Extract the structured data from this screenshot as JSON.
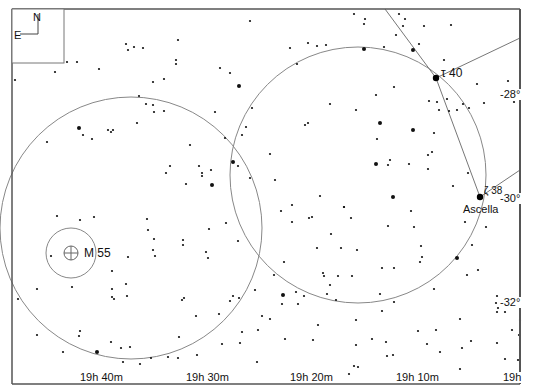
{
  "chart": {
    "type": "star-chart",
    "frame": {
      "left": 12,
      "top": 9,
      "right": 520,
      "bottom": 384,
      "color": "#555555"
    },
    "compass": {
      "north_label": "N",
      "east_label": "E"
    },
    "ra_labels": [
      {
        "text": "19h 40m",
        "x": 79
      },
      {
        "text": "19h 30m",
        "x": 185
      },
      {
        "text": "19h 20m",
        "x": 289
      },
      {
        "text": "19h 10m",
        "x": 395
      },
      {
        "text": "19h",
        "x": 502
      }
    ],
    "dec_labels": [
      {
        "text": "-28°",
        "x": 500,
        "y": 90
      },
      {
        "text": "-30°",
        "x": 500,
        "y": 194
      },
      {
        "text": "-32°",
        "x": 500,
        "y": 298
      }
    ],
    "circles": [
      {
        "name": "field-circle-left",
        "cx": 131,
        "cy": 228,
        "r": 131
      },
      {
        "name": "field-circle-right",
        "cx": 358,
        "cy": 175,
        "r": 128
      },
      {
        "name": "m55-ring",
        "cx": 71,
        "cy": 253,
        "r": 25
      }
    ],
    "constellation_lines": [
      [
        [
          385,
          9
        ],
        [
          436,
          78
        ]
      ],
      [
        [
          436,
          78
        ],
        [
          520,
          38
        ]
      ],
      [
        [
          436,
          78
        ],
        [
          480,
          197
        ]
      ],
      [
        [
          480,
          197
        ],
        [
          520,
          170
        ]
      ]
    ],
    "labeled_objects": [
      {
        "name": "M 55",
        "type": "globular-cluster",
        "x": 71,
        "y": 253,
        "label_x": 84,
        "label_y": 247
      },
      {
        "name": "τ 40",
        "type": "star",
        "x": 436,
        "y": 78,
        "label_x": 441,
        "label_y": 67
      },
      {
        "name": "Ascella",
        "type": "star",
        "x": 480,
        "y": 197,
        "label_x": 463,
        "label_y": 204
      },
      {
        "name": "ζ 38",
        "type": "star-designation",
        "x": 480,
        "y": 197,
        "label_x": 484,
        "label_y": 186
      }
    ],
    "stars": [
      [
        15,
        80,
        1
      ],
      [
        55,
        72,
        1
      ],
      [
        67,
        62,
        1
      ],
      [
        77,
        62,
        1
      ],
      [
        99,
        69,
        1
      ],
      [
        128,
        50,
        1
      ],
      [
        126,
        44,
        1
      ],
      [
        134,
        47,
        1
      ],
      [
        143,
        48,
        1
      ],
      [
        178,
        40,
        1
      ],
      [
        176,
        60,
        1
      ],
      [
        176,
        64,
        1
      ],
      [
        153,
        82,
        1
      ],
      [
        164,
        79,
        1
      ],
      [
        239,
        86,
        2
      ],
      [
        230,
        73,
        1
      ],
      [
        250,
        21,
        1
      ],
      [
        290,
        48,
        1
      ],
      [
        297,
        64,
        1
      ],
      [
        308,
        43,
        1
      ],
      [
        317,
        46,
        1
      ],
      [
        326,
        45,
        1
      ],
      [
        354,
        14,
        1
      ],
      [
        365,
        19,
        1
      ],
      [
        364,
        24,
        1
      ],
      [
        364,
        49,
        2
      ],
      [
        399,
        14,
        1
      ],
      [
        405,
        19,
        1
      ],
      [
        403,
        26,
        1
      ],
      [
        424,
        26,
        1
      ],
      [
        451,
        25,
        1
      ],
      [
        419,
        44,
        1
      ],
      [
        396,
        35,
        1
      ],
      [
        384,
        47,
        1
      ],
      [
        413,
        50,
        2
      ],
      [
        444,
        60,
        1
      ],
      [
        508,
        81,
        1
      ],
      [
        514,
        102,
        1
      ],
      [
        79,
        128,
        2
      ],
      [
        83,
        135,
        1
      ],
      [
        92,
        139,
        1
      ],
      [
        108,
        130,
        1
      ],
      [
        113,
        130,
        1
      ],
      [
        111,
        132,
        1
      ],
      [
        47,
        142,
        1
      ],
      [
        137,
        123,
        1
      ],
      [
        139,
        96,
        1
      ],
      [
        146,
        104,
        1
      ],
      [
        153,
        105,
        1
      ],
      [
        154,
        112,
        1
      ],
      [
        164,
        111,
        1
      ],
      [
        190,
        145,
        1
      ],
      [
        215,
        112,
        1
      ],
      [
        220,
        68,
        1
      ],
      [
        199,
        166,
        1
      ],
      [
        211,
        170,
        1
      ],
      [
        202,
        173,
        1
      ],
      [
        202,
        176,
        1
      ],
      [
        212,
        185,
        2
      ],
      [
        170,
        166,
        1
      ],
      [
        166,
        173,
        1
      ],
      [
        186,
        184,
        1
      ],
      [
        225,
        138,
        1
      ],
      [
        233,
        162,
        2
      ],
      [
        238,
        166,
        1
      ],
      [
        242,
        135,
        1
      ],
      [
        246,
        127,
        1
      ],
      [
        252,
        108,
        1
      ],
      [
        250,
        178,
        1
      ],
      [
        270,
        154,
        1
      ],
      [
        275,
        180,
        1
      ],
      [
        281,
        211,
        1
      ],
      [
        308,
        123,
        1
      ],
      [
        305,
        125,
        1
      ],
      [
        330,
        104,
        1
      ],
      [
        356,
        110,
        1
      ],
      [
        380,
        123,
        2
      ],
      [
        394,
        87,
        1
      ],
      [
        376,
        95,
        1
      ],
      [
        376,
        164,
        2
      ],
      [
        377,
        139,
        1
      ],
      [
        390,
        160,
        1
      ],
      [
        388,
        165,
        1
      ],
      [
        351,
        218,
        1
      ],
      [
        344,
        207,
        1
      ],
      [
        352,
        276,
        1
      ],
      [
        320,
        196,
        1
      ],
      [
        292,
        222,
        1
      ],
      [
        309,
        218,
        1
      ],
      [
        292,
        205,
        1
      ],
      [
        312,
        217,
        1
      ],
      [
        331,
        234,
        1
      ],
      [
        341,
        248,
        1
      ],
      [
        344,
        207,
        1
      ],
      [
        323,
        273,
        1
      ],
      [
        330,
        285,
        1
      ],
      [
        284,
        262,
        1
      ],
      [
        317,
        248,
        1
      ],
      [
        357,
        250,
        1
      ],
      [
        388,
        226,
        1
      ],
      [
        382,
        268,
        1
      ],
      [
        394,
        268,
        1
      ],
      [
        393,
        197,
        2
      ],
      [
        409,
        164,
        1
      ],
      [
        411,
        211,
        1
      ],
      [
        414,
        227,
        1
      ],
      [
        421,
        246,
        1
      ],
      [
        422,
        257,
        1
      ],
      [
        420,
        262,
        1
      ],
      [
        428,
        169,
        1
      ],
      [
        432,
        152,
        1
      ],
      [
        434,
        133,
        1
      ],
      [
        429,
        101,
        1
      ],
      [
        437,
        102,
        1
      ],
      [
        449,
        111,
        1
      ],
      [
        447,
        99,
        1
      ],
      [
        439,
        110,
        1
      ],
      [
        457,
        110,
        1
      ],
      [
        469,
        108,
        1
      ],
      [
        463,
        104,
        1
      ],
      [
        413,
        130,
        2
      ],
      [
        428,
        155,
        1
      ],
      [
        484,
        103,
        1
      ],
      [
        477,
        84,
        1
      ],
      [
        468,
        173,
        1
      ],
      [
        453,
        186,
        1
      ],
      [
        465,
        222,
        1
      ],
      [
        478,
        270,
        1
      ],
      [
        486,
        227,
        1
      ],
      [
        434,
        289,
        1
      ],
      [
        457,
        258,
        2
      ],
      [
        467,
        275,
        1
      ],
      [
        436,
        330,
        1
      ],
      [
        460,
        319,
        1
      ],
      [
        472,
        245,
        1
      ],
      [
        497,
        296,
        1
      ],
      [
        498,
        308,
        1
      ],
      [
        497,
        312,
        1
      ],
      [
        505,
        312,
        1
      ],
      [
        512,
        330,
        1
      ],
      [
        519,
        335,
        1
      ],
      [
        520,
        320,
        1
      ],
      [
        80,
        220,
        1
      ],
      [
        94,
        217,
        1
      ],
      [
        147,
        219,
        1
      ],
      [
        148,
        230,
        1
      ],
      [
        154,
        239,
        1
      ],
      [
        153,
        250,
        1
      ],
      [
        155,
        256,
        1
      ],
      [
        183,
        240,
        1
      ],
      [
        209,
        229,
        1
      ],
      [
        226,
        223,
        1
      ],
      [
        238,
        241,
        1
      ],
      [
        112,
        271,
        1
      ],
      [
        126,
        284,
        1
      ],
      [
        112,
        289,
        1
      ],
      [
        18,
        299,
        1
      ],
      [
        37,
        289,
        1
      ],
      [
        72,
        287,
        1
      ],
      [
        112,
        297,
        1
      ],
      [
        127,
        296,
        1
      ],
      [
        79,
        336,
        1
      ],
      [
        37,
        335,
        1
      ],
      [
        80,
        331,
        1
      ],
      [
        183,
        245,
        1
      ],
      [
        128,
        257,
        1
      ],
      [
        114,
        299,
        1
      ],
      [
        184,
        298,
        1
      ],
      [
        196,
        316,
        1
      ],
      [
        179,
        337,
        1
      ],
      [
        182,
        300,
        1
      ],
      [
        219,
        314,
        1
      ],
      [
        233,
        296,
        1
      ],
      [
        230,
        301,
        1
      ],
      [
        206,
        252,
        1
      ],
      [
        208,
        258,
        1
      ],
      [
        239,
        298,
        1
      ],
      [
        242,
        332,
        1
      ],
      [
        240,
        343,
        1
      ],
      [
        255,
        290,
        1
      ],
      [
        270,
        319,
        1
      ],
      [
        274,
        275,
        1
      ],
      [
        283,
        295,
        2
      ],
      [
        296,
        292,
        1
      ],
      [
        298,
        304,
        1
      ],
      [
        304,
        296,
        1
      ],
      [
        324,
        276,
        1
      ],
      [
        327,
        294,
        1
      ],
      [
        338,
        276,
        1
      ],
      [
        336,
        300,
        1
      ],
      [
        356,
        320,
        1
      ],
      [
        380,
        294,
        1
      ],
      [
        382,
        311,
        1
      ],
      [
        372,
        339,
        1
      ],
      [
        386,
        342,
        1
      ],
      [
        394,
        302,
        1
      ],
      [
        418,
        331,
        1
      ],
      [
        427,
        344,
        1
      ],
      [
        462,
        348,
        1
      ],
      [
        471,
        341,
        1
      ],
      [
        497,
        343,
        1
      ],
      [
        496,
        303,
        1
      ],
      [
        440,
        352,
        1
      ],
      [
        387,
        356,
        1
      ],
      [
        356,
        345,
        1
      ],
      [
        282,
        304,
        1
      ],
      [
        262,
        316,
        1
      ],
      [
        258,
        330,
        1
      ],
      [
        285,
        339,
        1
      ],
      [
        318,
        325,
        1
      ],
      [
        313,
        340,
        1
      ],
      [
        222,
        344,
        1
      ],
      [
        197,
        355,
        1
      ],
      [
        168,
        357,
        1
      ],
      [
        151,
        358,
        1
      ],
      [
        111,
        342,
        1
      ],
      [
        97,
        352,
        2
      ],
      [
        63,
        352,
        1
      ],
      [
        121,
        348,
        1
      ],
      [
        130,
        347,
        1
      ],
      [
        123,
        362,
        1
      ],
      [
        140,
        364,
        1
      ],
      [
        257,
        362,
        1
      ],
      [
        354,
        366,
        1
      ],
      [
        358,
        367,
        1
      ],
      [
        295,
        375,
        1
      ],
      [
        324,
        375,
        1
      ],
      [
        349,
        374,
        1
      ],
      [
        393,
        355,
        1
      ],
      [
        460,
        369,
        1
      ],
      [
        505,
        359,
        1
      ],
      [
        518,
        360,
        1
      ],
      [
        178,
        358,
        1
      ],
      [
        57,
        216,
        1
      ],
      [
        51,
        256,
        1
      ]
    ]
  }
}
